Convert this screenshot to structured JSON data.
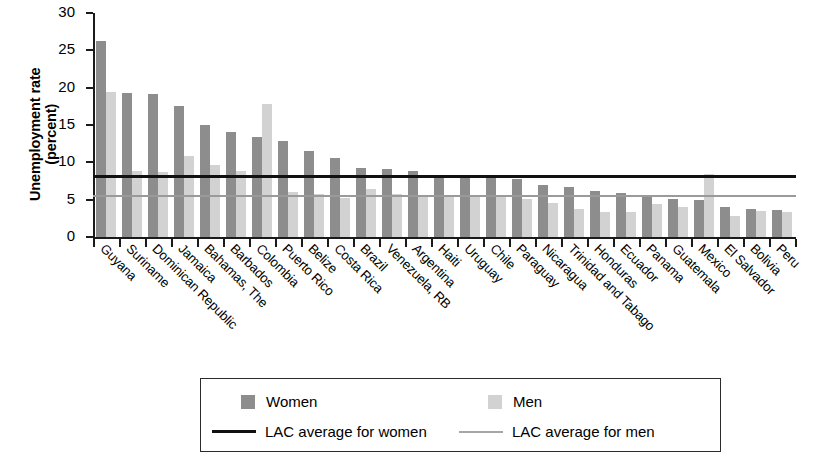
{
  "chart_data": {
    "type": "bar",
    "title": "",
    "subtitle": "",
    "xlabel": "",
    "ylabel": "Unemployment rate\n(percent)",
    "ylim": [
      0,
      30
    ],
    "yticks": [
      0,
      5,
      10,
      15,
      20,
      25,
      30
    ],
    "grid": false,
    "orientation": "vertical",
    "grouping": "grouped",
    "legend_position": "bottom",
    "categories": [
      "Guyana",
      "Suriname",
      "Dominican Republic",
      "Jamaica",
      "Bahamas, The",
      "Barbados",
      "Colombia",
      "Puerto Rico",
      "Belize",
      "Costa Rica",
      "Brazil",
      "Venezuela, RB",
      "Argentina",
      "Haiti",
      "Uruguay",
      "Chile",
      "Paraguay",
      "Nicaragua",
      "Trinidad and Tabago",
      "Honduras",
      "Ecuador",
      "Panama",
      "Guatemala",
      "Mexico",
      "El Salvador",
      "Bolivia",
      "Peru"
    ],
    "series": [
      {
        "name": "Women",
        "color": "#8d8d8d",
        "values": [
          26.2,
          19.3,
          19.2,
          17.6,
          15.0,
          14.0,
          13.4,
          12.8,
          11.5,
          10.6,
          9.2,
          9.1,
          8.8,
          8.3,
          8.0,
          7.9,
          7.8,
          7.0,
          6.7,
          6.1,
          5.9,
          5.6,
          5.1,
          4.9,
          4.0,
          3.7,
          3.6
        ]
      },
      {
        "name": "Men",
        "color": "#d2d2d2",
        "values": [
          19.4,
          8.8,
          8.7,
          10.8,
          9.7,
          8.8,
          17.8,
          6.0,
          5.8,
          5.2,
          6.4,
          5.8,
          5.6,
          5.5,
          5.3,
          5.4,
          5.1,
          4.5,
          3.7,
          3.4,
          3.3,
          4.4,
          4.0,
          8.5,
          2.8,
          3.5,
          3.4
        ]
      }
    ],
    "reference_lines": [
      {
        "name": "LAC average for women",
        "value": 8.2,
        "color": "#111111",
        "style": "solid-thick"
      },
      {
        "name": "LAC average for men",
        "value": 5.5,
        "color": "#9a9a9a",
        "style": "solid-thin"
      }
    ],
    "legend": [
      {
        "label": "Women",
        "marker": "square",
        "color": "#8d8d8d"
      },
      {
        "label": "Men",
        "marker": "square",
        "color": "#d2d2d2"
      },
      {
        "label": "LAC average for women",
        "marker": "line",
        "color": "#111111"
      },
      {
        "label": "LAC average for men",
        "marker": "line",
        "color": "#9a9a9a"
      }
    ]
  }
}
